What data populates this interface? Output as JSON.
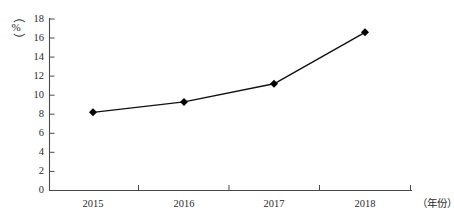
{
  "chart_data": {
    "type": "line",
    "title": "",
    "xlabel": "（年份）",
    "ylabel": "（%）",
    "categories": [
      "2015",
      "2016",
      "2017",
      "2018"
    ],
    "values": [
      8.2,
      9.3,
      11.2,
      16.6
    ],
    "series": [
      {
        "name": "",
        "values": [
          8.2,
          9.3,
          11.2,
          16.6
        ]
      }
    ],
    "ylim": [
      0,
      18
    ],
    "ytick_step": 2,
    "ytick_labels": [
      "0",
      "2",
      "4",
      "6",
      "8",
      "10",
      "12",
      "14",
      "16",
      "18"
    ],
    "xtick_labels": [
      "2015",
      "2016",
      "2017",
      "2018"
    ],
    "grid": false,
    "legend": false,
    "legend_position": "none",
    "marker": "diamond",
    "line_color": "#111111",
    "marker_color": "#000000",
    "axis_color": "#4a4a4a",
    "background_color": "#ffffff"
  },
  "axes": {
    "y_unit_open_paren": "（",
    "y_unit_symbol": "%",
    "y_unit_close_paren": "）",
    "x_unit": "（年份）"
  }
}
